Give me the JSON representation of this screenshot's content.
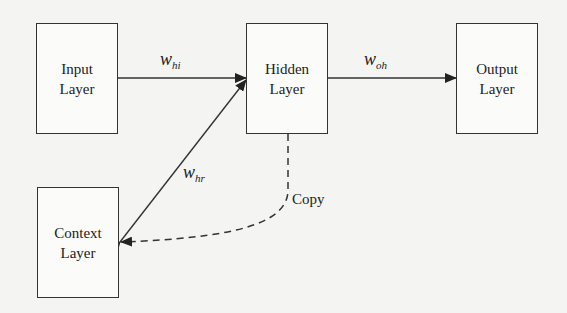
{
  "diagram": {
    "type": "elman-recurrent-network",
    "nodes": {
      "input": {
        "line1": "Input",
        "line2": "Layer"
      },
      "hidden": {
        "line1": "Hidden",
        "line2": "Layer"
      },
      "output": {
        "line1": "Output",
        "line2": "Layer"
      },
      "context": {
        "line1": "Context",
        "line2": "Layer"
      }
    },
    "edges": {
      "w_hi": {
        "base": "w",
        "sub": "hi",
        "from": "input",
        "to": "hidden"
      },
      "w_oh": {
        "base": "w",
        "sub": "oh",
        "from": "hidden",
        "to": "output"
      },
      "w_hr": {
        "base": "w",
        "sub": "hr",
        "from": "context",
        "to": "hidden",
        "bidirectional": true
      },
      "copy": {
        "label": "Copy",
        "from": "hidden",
        "to": "context",
        "style": "dashed"
      }
    },
    "colors": {
      "stroke": "#333333",
      "background": "#f4f4f2",
      "bleed_text": "#dcdcda"
    }
  }
}
